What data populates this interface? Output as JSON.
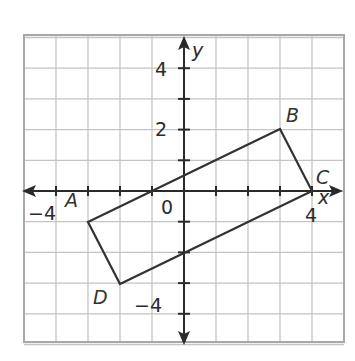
{
  "diagram": {
    "type": "coordinate-plane",
    "grid": {
      "x_min": -5,
      "x_max": 5,
      "y_min": -5,
      "y_max": 5,
      "cell_px_x": 32,
      "cell_px_y": 30.7
    },
    "axes": {
      "x_label": "x",
      "y_label": "y",
      "origin_label": "0",
      "x_tick_labels": [
        {
          "value": -4,
          "text": "−4"
        },
        {
          "value": 4,
          "text": "4"
        }
      ],
      "y_tick_labels": [
        {
          "value": 4,
          "text": "4"
        },
        {
          "value": 2,
          "text": "2"
        },
        {
          "value": -4,
          "text": "−4"
        }
      ]
    },
    "polygon": {
      "name": "ABCD",
      "vertices": [
        {
          "label": "A",
          "x": -3,
          "y": -1
        },
        {
          "label": "B",
          "x": 3,
          "y": 2
        },
        {
          "label": "C",
          "x": 4,
          "y": 0
        },
        {
          "label": "D",
          "x": -2,
          "y": -3
        }
      ]
    },
    "colors": {
      "grid": "#bdbdbd",
      "axis": "#2a2a2a",
      "polygon": "#333333",
      "frame": "#a8a8a8"
    }
  }
}
